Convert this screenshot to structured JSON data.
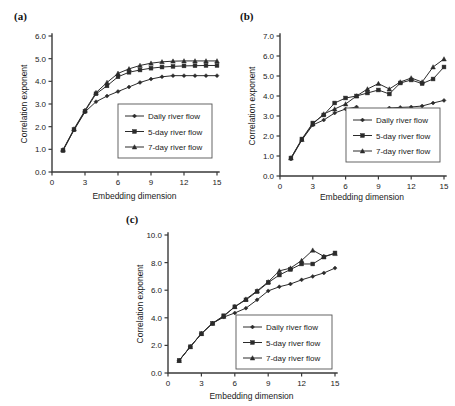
{
  "figure": {
    "panels": [
      {
        "tag": "(a)",
        "id": "a"
      },
      {
        "tag": "(b)",
        "id": "b"
      },
      {
        "tag": "(c)",
        "id": "c"
      }
    ]
  },
  "chart_data": [
    {
      "type": "line",
      "panel": "(a)",
      "title": "",
      "xlabel": "Embedding dimension",
      "ylabel": "Correlation exponent",
      "xlim": [
        0,
        15
      ],
      "ylim": [
        0.0,
        6.0
      ],
      "xticks": [
        0,
        3,
        6,
        9,
        12,
        15
      ],
      "yticks": [
        "0.0",
        "1.0",
        "2.0",
        "3.0",
        "4.0",
        "5.0",
        "6.0"
      ],
      "grid": false,
      "legend_position": "center-right",
      "x": [
        1,
        2,
        3,
        4,
        5,
        6,
        7,
        8,
        9,
        10,
        11,
        12,
        13,
        14,
        15
      ],
      "series": [
        {
          "name": "Daily river flow",
          "marker": "diamond",
          "values": [
            0.95,
            1.85,
            2.65,
            3.1,
            3.35,
            3.55,
            3.75,
            3.95,
            4.1,
            4.2,
            4.25,
            4.25,
            4.25,
            4.25,
            4.25
          ]
        },
        {
          "name": "5-day river flow",
          "marker": "square",
          "values": [
            0.95,
            1.87,
            2.68,
            3.45,
            3.8,
            4.2,
            4.4,
            4.5,
            4.58,
            4.63,
            4.66,
            4.68,
            4.69,
            4.7,
            4.7
          ]
        },
        {
          "name": "7-day river flow",
          "marker": "triangle",
          "values": [
            0.98,
            1.9,
            2.72,
            3.5,
            3.95,
            4.35,
            4.55,
            4.7,
            4.8,
            4.86,
            4.89,
            4.9,
            4.9,
            4.9,
            4.9
          ]
        }
      ]
    },
    {
      "type": "line",
      "panel": "(b)",
      "title": "",
      "xlabel": "Embedding dimension",
      "ylabel": "Correlation exponent",
      "xlim": [
        0,
        15
      ],
      "ylim": [
        0.0,
        7.0
      ],
      "xticks": [
        0,
        3,
        6,
        9,
        12,
        15
      ],
      "yticks": [
        "0.0",
        "1.0",
        "2.0",
        "3.0",
        "4.0",
        "5.0",
        "6.0",
        "7.0"
      ],
      "grid": false,
      "legend_position": "center-right",
      "x": [
        1,
        2,
        3,
        4,
        5,
        6,
        7,
        8,
        9,
        10,
        11,
        12,
        13,
        14,
        15
      ],
      "series": [
        {
          "name": "Daily river flow",
          "marker": "diamond",
          "values": [
            0.85,
            1.8,
            2.55,
            2.8,
            3.15,
            3.35,
            3.45,
            3.15,
            3.3,
            3.4,
            3.43,
            3.45,
            3.5,
            3.65,
            3.78
          ]
        },
        {
          "name": "5-day river flow",
          "marker": "square",
          "values": [
            0.9,
            1.85,
            2.65,
            3.05,
            3.65,
            3.9,
            4.0,
            4.15,
            4.3,
            4.1,
            4.65,
            4.8,
            4.62,
            4.85,
            5.45
          ]
        },
        {
          "name": "7-day river flow",
          "marker": "triangle",
          "values": [
            0.9,
            1.82,
            2.6,
            3.1,
            3.35,
            3.6,
            4.0,
            4.35,
            4.62,
            4.35,
            4.7,
            4.9,
            4.7,
            5.45,
            5.85
          ]
        }
      ]
    },
    {
      "type": "line",
      "panel": "(c)",
      "title": "",
      "xlabel": "Embedding dimension",
      "ylabel": "Correlation exponent",
      "xlim": [
        0,
        15
      ],
      "ylim": [
        0.0,
        10.0
      ],
      "xticks": [
        0,
        3,
        6,
        9,
        12,
        15
      ],
      "yticks": [
        "0.0",
        "2.0",
        "4.0",
        "6.0",
        "8.0",
        "10.0"
      ],
      "grid": false,
      "legend_position": "bottom-right",
      "x": [
        1,
        2,
        3,
        4,
        5,
        6,
        7,
        8,
        9,
        10,
        11,
        12,
        13,
        14,
        15
      ],
      "series": [
        {
          "name": "Daily river flow",
          "marker": "diamond",
          "values": [
            0.9,
            1.9,
            2.85,
            3.6,
            4.05,
            4.35,
            4.7,
            5.3,
            5.95,
            6.25,
            6.45,
            6.75,
            7.0,
            7.25,
            7.6
          ]
        },
        {
          "name": "5-day river flow",
          "marker": "square",
          "values": [
            0.9,
            1.9,
            2.85,
            3.6,
            4.15,
            4.8,
            5.3,
            5.9,
            6.55,
            7.1,
            7.5,
            7.9,
            7.9,
            8.4,
            8.7
          ]
        },
        {
          "name": "7-day river flow",
          "marker": "triangle",
          "values": [
            0.9,
            1.9,
            2.85,
            3.6,
            4.1,
            4.8,
            5.35,
            5.95,
            6.6,
            7.4,
            7.6,
            8.15,
            8.9,
            8.45,
            8.65
          ]
        }
      ]
    }
  ]
}
